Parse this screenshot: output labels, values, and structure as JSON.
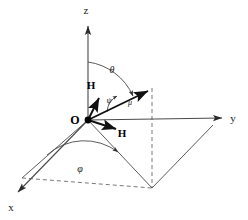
{
  "figure": {
    "background_color": "#ffffff",
    "line_color": "#3a3a3a",
    "solid_color": "#000000",
    "dashed_color": "#555555"
  },
  "axes": {
    "z": {
      "label": "z",
      "x": 86,
      "y": 14
    },
    "y": {
      "label": "y",
      "x": 233,
      "y": 122
    },
    "x": {
      "label": "x",
      "x": 11,
      "y": 211
    }
  },
  "origin": {
    "label": "O",
    "x": 75,
    "y": 124
  },
  "vectors": [
    {
      "name": "magnetic-moment",
      "label": "μ",
      "label_x": 130,
      "label_y": 105,
      "tip_x": 152,
      "tip_y": 88
    },
    {
      "name": "field-upper",
      "label": "H",
      "label_x": 91,
      "label_y": 89,
      "tip_x": 97,
      "tip_y": 96
    },
    {
      "name": "field-lower",
      "label": "H",
      "label_x": 122,
      "label_y": 137,
      "tip_x": 118,
      "tip_y": 130
    }
  ],
  "angles": [
    {
      "name": "theta",
      "label": "θ",
      "label_x": 112,
      "label_y": 73
    },
    {
      "name": "phi",
      "label": "φ",
      "label_x": 80,
      "label_y": 172
    },
    {
      "name": "psi",
      "label": "ψ",
      "label_x": 109,
      "label_y": 103
    }
  ],
  "plane": {
    "name": "base-parallelogram",
    "corners": [
      {
        "x": 88,
        "y": 120
      },
      {
        "x": 213,
        "y": 125
      },
      {
        "x": 152,
        "y": 188
      },
      {
        "x": 22,
        "y": 178
      }
    ]
  }
}
